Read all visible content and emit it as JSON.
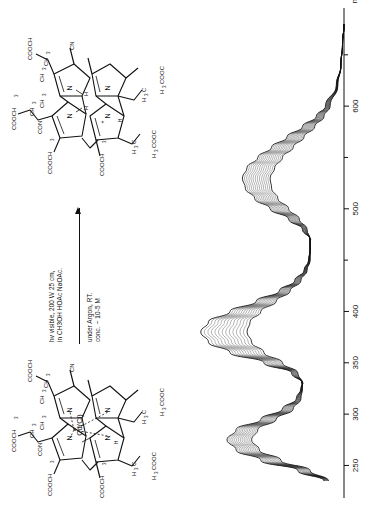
{
  "figure": {
    "orientation": "rotated-90-ccw",
    "kind": "reaction-scheme-with-uv-vis-spectra"
  },
  "scheme": {
    "reactant": {
      "name": "cadmium-chloro-corrinoid",
      "core_label": "Cd(Cl)",
      "ring_nitrogens": [
        "N",
        "N",
        "N",
        "N"
      ],
      "substituents": [
        "COOCH3",
        "CON",
        "CH3",
        "CH3",
        "CH3",
        "COOCH3",
        "CH3",
        "CH3",
        "COOCH3",
        "CN",
        "H3C",
        "H3C",
        "H3C",
        "H3COOC",
        "H3COOC",
        "H3C",
        "H"
      ]
    },
    "product": {
      "name": "metal-free-protonated-corrinoid",
      "core_label": "",
      "ring_nitrogens": [
        "N",
        "N",
        "N",
        "N"
      ],
      "nh_labels": [
        "H",
        "H"
      ],
      "charge_label": "+",
      "substituents": [
        "COOCH3",
        "CON",
        "CH3",
        "CH3",
        "CH3",
        "COOCH3",
        "CH3",
        "CH3",
        "COOCH3",
        "CN",
        "H3C",
        "H3C",
        "H3C",
        "H3COOC",
        "H3COOC",
        "H3C",
        "H"
      ]
    },
    "conditions_above_1": "hv  visible, 200 W 25 cm,",
    "conditions_above_2": "in CH3OH HOAc  NaOAc.",
    "conditions_below_1": "under Argon, RT.",
    "conditions_below_2": "conc. ~ 10-5 M",
    "arrow": "reaction-arrow-right"
  },
  "chart_data": {
    "type": "line",
    "title": "",
    "xlabel": "nm",
    "ylabel": "",
    "xlim": [
      230,
      680
    ],
    "ylim": [
      0,
      1.0
    ],
    "grid": false,
    "legend": "none",
    "axis": "x-only-bottom",
    "unit_label": "nm",
    "tick_labels": [
      "250",
      "300",
      "350",
      "400",
      "500",
      "600"
    ],
    "tick_values": [
      250,
      300,
      350,
      400,
      500,
      600
    ],
    "minor_tick_values": [
      450,
      550,
      650
    ],
    "series_count": 14,
    "series_description": "family of UV-Vis absorption spectra recorded during photolysis, crossing at isosbestic points",
    "isosbestic_points_nm": [
      330,
      470
    ],
    "x": [
      235,
      245,
      255,
      265,
      275,
      285,
      295,
      305,
      315,
      325,
      330,
      340,
      350,
      360,
      370,
      380,
      390,
      400,
      410,
      420,
      430,
      440,
      450,
      460,
      470,
      480,
      490,
      500,
      510,
      520,
      530,
      540,
      550,
      560,
      570,
      580,
      590,
      600,
      620,
      640,
      660,
      680
    ],
    "series": [
      {
        "name": "spectrum-1-initial",
        "values": [
          0.1,
          0.22,
          0.41,
          0.55,
          0.6,
          0.56,
          0.44,
          0.33,
          0.28,
          0.27,
          0.27,
          0.34,
          0.52,
          0.74,
          0.88,
          0.93,
          0.88,
          0.74,
          0.57,
          0.42,
          0.32,
          0.26,
          0.23,
          0.22,
          0.22,
          0.24,
          0.29,
          0.36,
          0.43,
          0.47,
          0.48,
          0.45,
          0.4,
          0.33,
          0.26,
          0.19,
          0.13,
          0.09,
          0.04,
          0.02,
          0.01,
          0.0
        ]
      },
      {
        "name": "spectrum-14-final",
        "values": [
          0.13,
          0.3,
          0.54,
          0.7,
          0.76,
          0.7,
          0.54,
          0.4,
          0.31,
          0.28,
          0.27,
          0.3,
          0.4,
          0.52,
          0.6,
          0.63,
          0.61,
          0.54,
          0.44,
          0.35,
          0.28,
          0.24,
          0.22,
          0.22,
          0.22,
          0.27,
          0.36,
          0.48,
          0.58,
          0.64,
          0.66,
          0.63,
          0.56,
          0.47,
          0.37,
          0.27,
          0.18,
          0.12,
          0.05,
          0.02,
          0.01,
          0.0
        ]
      }
    ]
  }
}
